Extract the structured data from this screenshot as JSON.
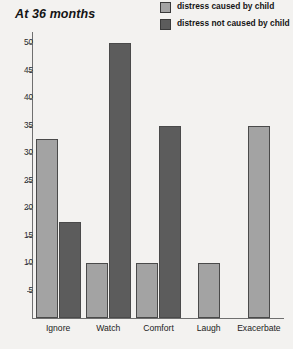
{
  "chart_data": {
    "type": "bar",
    "title": "At 36 months",
    "xlabel": "",
    "ylabel": "",
    "ylim": [
      0,
      52
    ],
    "yticks": [
      5,
      10,
      15,
      20,
      25,
      30,
      35,
      40,
      45,
      50
    ],
    "grid": false,
    "legend_position": "top-right",
    "categories": [
      "Ignore",
      "Watch",
      "Comfort",
      "Laugh",
      "Exacerbate"
    ],
    "series": [
      {
        "name": "distress caused by child",
        "color": "#a3a3a3",
        "values": [
          32.5,
          10,
          10,
          10,
          35
        ]
      },
      {
        "name": "distress not caused by child",
        "color": "#5c5c5c",
        "values": [
          17.5,
          50,
          35,
          null,
          null
        ]
      }
    ]
  },
  "legend": {
    "items": [
      {
        "label": "distress caused by child",
        "swatch": "light"
      },
      {
        "label": "distress not caused by child",
        "swatch": "dark"
      }
    ]
  },
  "colors": {
    "background": "#f3f2f0",
    "axis": "#6f6f6f",
    "bar_outline": "#4a4a4a",
    "series_light": "#a3a3a3",
    "series_dark": "#5c5c5c",
    "text": "#1a1a1a"
  }
}
